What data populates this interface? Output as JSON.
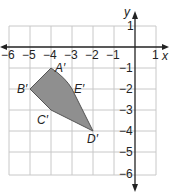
{
  "diagram": {
    "type": "coordinate-grid",
    "x_axis_label": "x",
    "y_axis_label": "y",
    "x_ticks": [
      "−6",
      "−5",
      "−4",
      "−3",
      "−2",
      "−1",
      "1"
    ],
    "y_ticks": [
      "1",
      "−1",
      "−2",
      "−3",
      "−4",
      "−5",
      "−6"
    ],
    "x_range": [
      -6,
      1
    ],
    "y_range": [
      -6,
      1
    ],
    "shape_fill": "#8f8f8f",
    "vertices": [
      {
        "label": "A′",
        "x": -4,
        "y": -1
      },
      {
        "label": "E′",
        "x": -3,
        "y": -2
      },
      {
        "label": "D′",
        "x": -2,
        "y": -4
      },
      {
        "label": "C′",
        "x": -4,
        "y": -3
      },
      {
        "label": "B′",
        "x": -5,
        "y": -2
      }
    ]
  }
}
